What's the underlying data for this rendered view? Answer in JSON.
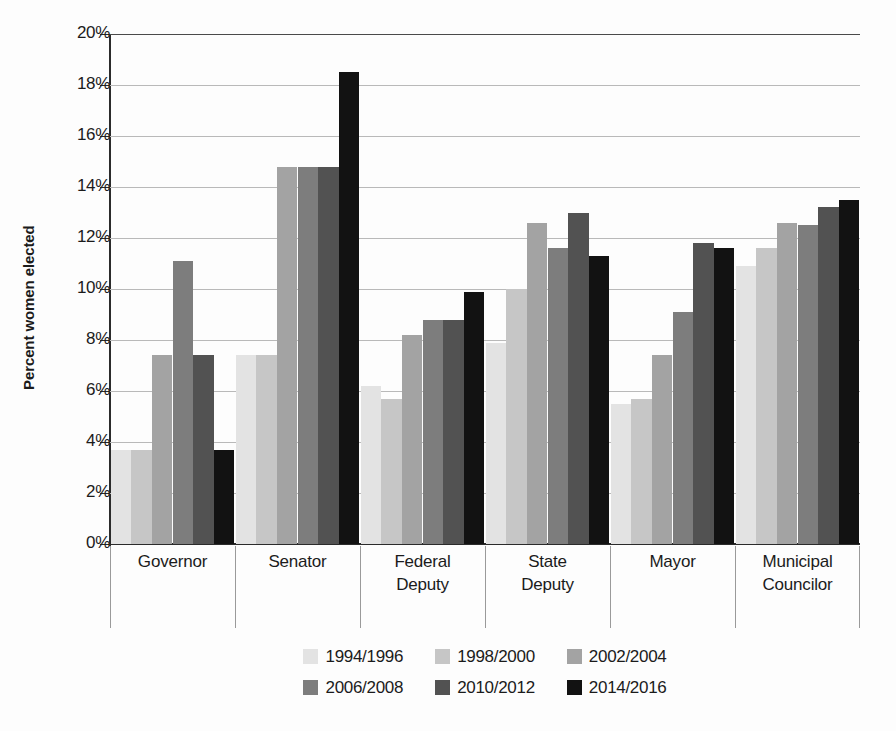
{
  "chart_data": {
    "type": "bar",
    "title": "",
    "xlabel": "",
    "ylabel": "Percent women elected",
    "ylim": [
      0,
      20
    ],
    "ytick_step": 2,
    "ytick_labels": [
      "0%",
      "2%",
      "4%",
      "6%",
      "8%",
      "10%",
      "12%",
      "14%",
      "16%",
      "18%",
      "20%"
    ],
    "ytick_values": [
      0,
      2,
      4,
      6,
      8,
      10,
      12,
      14,
      16,
      18,
      20
    ],
    "grid": true,
    "legend_position": "bottom",
    "categories": [
      "Governor",
      "Senator",
      "Federal Deputy",
      "State Deputy",
      "Mayor",
      "Municipal Councilor"
    ],
    "category_lines": [
      [
        "Governor"
      ],
      [
        "Senator"
      ],
      [
        "Federal",
        "Deputy"
      ],
      [
        "State",
        "Deputy"
      ],
      [
        "Mayor"
      ],
      [
        "Municipal",
        "Councilor"
      ]
    ],
    "series": [
      {
        "name": "1994/1996",
        "color": "#e3e3e3",
        "values": [
          3.7,
          7.4,
          6.2,
          7.9,
          5.5,
          10.9
        ]
      },
      {
        "name": "1998/2000",
        "color": "#c6c6c6",
        "values": [
          3.7,
          7.4,
          5.7,
          10.0,
          5.7,
          11.6
        ]
      },
      {
        "name": "2002/2004",
        "color": "#a3a3a3",
        "values": [
          7.4,
          14.8,
          8.2,
          12.6,
          7.4,
          12.6
        ]
      },
      {
        "name": "2006/2008",
        "color": "#7d7d7d",
        "values": [
          11.1,
          14.8,
          8.8,
          11.6,
          9.1,
          12.5
        ]
      },
      {
        "name": "2010/2012",
        "color": "#525252",
        "values": [
          7.4,
          14.8,
          8.8,
          13.0,
          11.8,
          13.2
        ]
      },
      {
        "name": "2014/2016",
        "color": "#121212",
        "values": [
          3.7,
          18.5,
          9.9,
          11.3,
          11.6,
          13.5
        ]
      }
    ]
  }
}
